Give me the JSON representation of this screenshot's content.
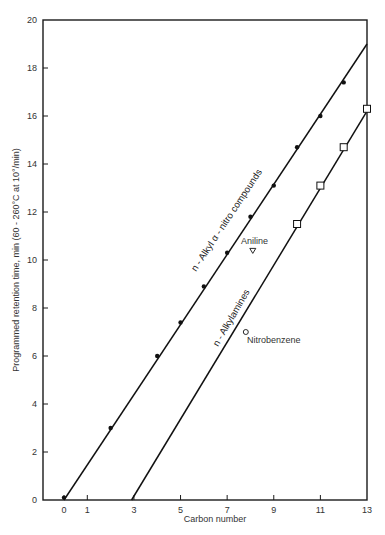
{
  "chart_data": {
    "type": "scatter",
    "title": "",
    "xlabel": "Carbon number",
    "ylabel": "Programmed retention time, min (60 - 260°C at 10°/min)",
    "xlim": [
      -1.5,
      13
    ],
    "ylim": [
      0,
      20
    ],
    "x_ticks": [
      0,
      1,
      3,
      5,
      7,
      9,
      11,
      13
    ],
    "y_ticks": [
      0,
      2,
      4,
      6,
      8,
      10,
      12,
      14,
      16,
      18,
      20
    ],
    "grid": false,
    "legend": null,
    "series": [
      {
        "name": "n-Alkyl α-nitro compounds",
        "marker": "filled-circle",
        "points": [
          {
            "x": 0,
            "y": 0.1
          },
          {
            "x": 2,
            "y": 3.0
          },
          {
            "x": 4,
            "y": 6.0
          },
          {
            "x": 5,
            "y": 7.4
          },
          {
            "x": 6,
            "y": 8.9
          },
          {
            "x": 7,
            "y": 10.3
          },
          {
            "x": 8,
            "y": 11.8
          },
          {
            "x": 9,
            "y": 13.1
          },
          {
            "x": 10,
            "y": 14.7
          },
          {
            "x": 11,
            "y": 16.0
          },
          {
            "x": 12,
            "y": 17.4
          }
        ],
        "fit_line": {
          "x0": 0,
          "y0": 0,
          "x1": 13,
          "y1": 19.0
        }
      },
      {
        "name": "n-Alkylamines",
        "marker": "open-square",
        "points": [
          {
            "x": 10,
            "y": 11.5
          },
          {
            "x": 11,
            "y": 13.1
          },
          {
            "x": 12,
            "y": 14.7
          },
          {
            "x": 13,
            "y": 16.3
          }
        ],
        "fit_line": {
          "x0": 2.9,
          "y0": 0,
          "x1": 13,
          "y1": 16.2
        }
      },
      {
        "name": "Aniline",
        "marker": "open-triangle-down",
        "points": [
          {
            "x": 8.1,
            "y": 10.4
          }
        ]
      },
      {
        "name": "Nitrobenzene",
        "marker": "open-circle",
        "points": [
          {
            "x": 7.8,
            "y": 7.0
          }
        ]
      }
    ],
    "annotations": [
      {
        "text": "Aniline",
        "x": 8.1,
        "y": 10.4
      },
      {
        "text": "Nitrobenzene",
        "x": 7.8,
        "y": 7.0
      },
      {
        "text": "n-Alkyl α-nitro compounds",
        "along": "series0"
      },
      {
        "text": "n-Alkylamines",
        "along": "series1"
      }
    ]
  },
  "labels": {
    "xlabel": "Carbon number",
    "ylabel": "Programmed retention time, min (60 - 260°C at 10°/min)",
    "nitro_series": "n - Alkyl  α - nitro compounds",
    "amine_series": "n - Alkylamines",
    "aniline": "Aniline",
    "nitrobenzene": "Nitrobenzene"
  }
}
